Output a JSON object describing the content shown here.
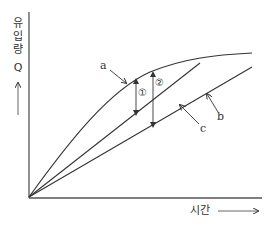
{
  "diagram": {
    "y_axis": {
      "label_chars": [
        "유",
        "입",
        "량"
      ],
      "symbol": "Q",
      "arrow": "up-arrow"
    },
    "x_axis": {
      "label": "시간",
      "arrow": "right-arrow"
    },
    "curves": [
      {
        "id": "a",
        "label": "a",
        "type": "concave-curve"
      },
      {
        "id": "c",
        "label": "c",
        "type": "straight-line"
      },
      {
        "id": "b",
        "label": "b",
        "type": "straight-line"
      }
    ],
    "markers": [
      {
        "id": "1",
        "label": "①",
        "from": "a",
        "to": "c"
      },
      {
        "id": "2",
        "label": "②",
        "from": "a",
        "to": "b"
      }
    ],
    "colors": {
      "line": "#333333",
      "background": "#ffffff"
    }
  }
}
